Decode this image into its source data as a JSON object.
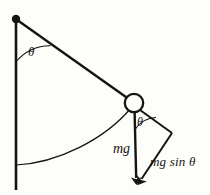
{
  "figure": {
    "background_color": "#fdfdfa",
    "stroke_color": "#141414",
    "labels": {
      "theta_upper": "θ",
      "theta_at_bob": "θ",
      "weight": "mg",
      "tangential_component": "mg sin θ"
    },
    "geometry": {
      "pivot": {
        "x": 16,
        "y": 19,
        "dot_radius": 4.2
      },
      "vertical_reference_line": {
        "x": 16,
        "y_top": 19,
        "y_bottom": 190
      },
      "string": {
        "x1": 16,
        "y1": 19,
        "x2": 134,
        "y2": 103
      },
      "bob": {
        "cx": 134,
        "cy": 103,
        "r": 9.5
      },
      "angle_arc_upper": {
        "cx": 16,
        "cy": 19,
        "radius": 43,
        "from_deg": 90,
        "to_deg": 35
      },
      "swing_arc": {
        "from_x": 16,
        "from_y": 165,
        "to_x": 134,
        "to_y": 103
      },
      "weight_vector": {
        "x1": 134,
        "y1": 103,
        "x2": 136,
        "y2": 186
      },
      "component_corner": {
        "x": 172,
        "y": 133
      },
      "component_vector": {
        "x1": 172,
        "y1": 133,
        "x2": 137,
        "y2": 186
      },
      "angle_arc_bob": {
        "cx": 134,
        "cy": 103,
        "radius": 26,
        "from_deg": 90,
        "to_deg": 56
      }
    }
  }
}
